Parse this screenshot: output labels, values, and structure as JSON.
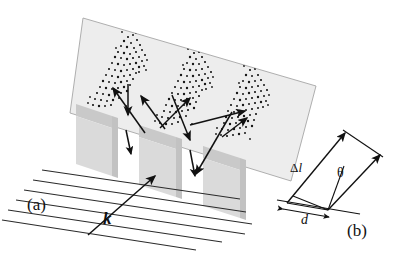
{
  "figure": {
    "type": "diffraction-grating-schematic",
    "background_color": "#ffffff",
    "ink_color": "#1a1a1a",
    "panels": [
      {
        "id": "a",
        "caption": "(a)",
        "description": "Perspective view of plane wave incident on a diffraction grating producing speckled diffracted beams on a tilted screen"
      },
      {
        "id": "b",
        "caption": "(b)",
        "description": "Geometry of path difference between two adjacent grating slits"
      }
    ],
    "labels": {
      "panel_a": "(a)",
      "panel_b": "(b)",
      "wavevector": "k",
      "path_difference": "Δl",
      "path_difference_delta": "Δ",
      "path_difference_l": "l",
      "angle": "θ",
      "spacing": "d"
    },
    "screen": {
      "name": "detection-screen",
      "fill": "#eeeeee",
      "stroke": "#9a9a9a",
      "corners": [
        [
          83,
          18
        ],
        [
          316,
          86
        ],
        [
          291,
          181
        ],
        [
          70,
          113
        ]
      ]
    },
    "grating": {
      "name": "grating-slabs",
      "slab_count": 3,
      "top_face_fill": "#c8c8c8",
      "front_face_fill": "#d8d8d8",
      "side_face_fill": "#bcbcbc",
      "slabs": [
        {
          "x": 76,
          "y": 104
        },
        {
          "x": 140,
          "y": 125
        },
        {
          "x": 203,
          "y": 146
        }
      ]
    },
    "wavefronts": {
      "name": "incident-plane-wave-lines",
      "count": 6,
      "stroke": "#2a2a2a",
      "lines": [
        [
          [
            42,
            170
          ],
          [
            240,
            199
          ]
        ],
        [
          [
            33,
            180
          ],
          [
            246,
            212
          ]
        ],
        [
          [
            24,
            190
          ],
          [
            252,
            224
          ]
        ],
        [
          [
            16,
            200
          ],
          [
            245,
            234
          ]
        ],
        [
          [
            8,
            210
          ],
          [
            222,
            242
          ]
        ],
        [
          [
            2,
            220
          ],
          [
            196,
            249
          ]
        ]
      ]
    },
    "beams": {
      "name": "diffracted-beam-arrows",
      "count": 8,
      "stroke": "#111111"
    },
    "speckle_clusters": {
      "name": "diffraction-spot-clusters",
      "count": 3,
      "dot_color": "#151515",
      "clusters": [
        {
          "cx": 118,
          "cy": 72,
          "label": "left-order"
        },
        {
          "cx": 186,
          "cy": 90,
          "label": "center-order"
        },
        {
          "cx": 242,
          "cy": 108,
          "label": "right-order"
        }
      ]
    },
    "geometry_b": {
      "baseline": [
        [
          278,
          201
        ],
        [
          358,
          214
        ]
      ],
      "ray_left_from": [
        287,
        203
      ],
      "ray_left_to": [
        345,
        134
      ],
      "ray_right_from": [
        327,
        210
      ],
      "ray_right_to": [
        378,
        155
      ],
      "hypotenuse": [
        [
          345,
          134
        ],
        [
          378,
          155
        ]
      ],
      "theta_vertex": [
        327,
        210
      ]
    }
  }
}
